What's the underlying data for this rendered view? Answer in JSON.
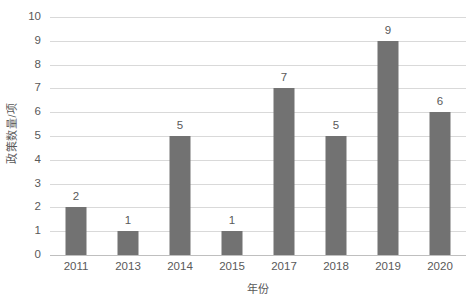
{
  "chart_data": {
    "type": "bar",
    "title": "",
    "subtitle": "",
    "xlabel": "年份",
    "ylabel": "政策数量/项",
    "categories": [
      "2011",
      "2013",
      "2014",
      "2015",
      "2017",
      "2018",
      "2019",
      "2020"
    ],
    "values": [
      2,
      1,
      5,
      1,
      7,
      5,
      9,
      6
    ],
    "data_labels": [
      "2",
      "1",
      "5",
      "1",
      "7",
      "5",
      "9",
      "6"
    ],
    "series": [
      {
        "name": "政策数量/项",
        "values": [
          2,
          1,
          5,
          1,
          7,
          5,
          9,
          6
        ]
      }
    ],
    "ylim": [
      0,
      10
    ],
    "ytick_values": [
      0,
      1,
      2,
      3,
      4,
      5,
      6,
      7,
      8,
      9,
      10
    ],
    "ytick_labels": [
      "0",
      "1",
      "2",
      "3",
      "4",
      "5",
      "6",
      "7",
      "8",
      "9",
      "10"
    ],
    "ytick_interval": 1,
    "grid": true,
    "grid_axis": "y",
    "legend": false,
    "legend_position": "none",
    "bar_color": "#727272",
    "gridline_color": "#d9d9d9",
    "axis_color": "#bfbfbf",
    "text_color": "#595959",
    "background_color": "#ffffff",
    "data_labels_visible": true,
    "annotations": []
  }
}
